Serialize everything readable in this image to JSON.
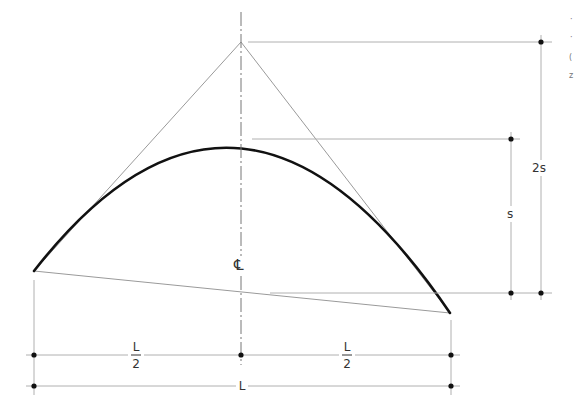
{
  "diagram": {
    "labels": {
      "rise_double": "2s",
      "rise": "s",
      "centerline": "℄",
      "half_span_left_num": "L",
      "half_span_left_den": "2",
      "half_span_right_num": "L",
      "half_span_right_den": "2",
      "span": "L"
    },
    "edge_fragments": [
      "·",
      "·",
      "(",
      "z"
    ],
    "colors": {
      "curve": "#111111",
      "construction": "#9a9a9a",
      "dimension": "#b0b0b0",
      "dot": "#111111"
    }
  }
}
